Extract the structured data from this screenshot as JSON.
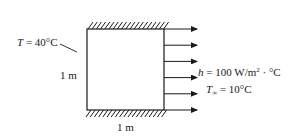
{
  "diagram": {
    "type": "heat-transfer-square-plate",
    "left_boundary": {
      "symbol": "T",
      "equals": " = ",
      "value": "40°C"
    },
    "left_dimension": "1 m",
    "bottom_dimension": "1 m",
    "top_boundary": "insulated",
    "bottom_boundary": "insulated",
    "right_boundary": {
      "type": "convection",
      "arrow_count": 6,
      "h_symbol": "h",
      "h_equals": " = 100 W/m",
      "h_exponent": "2",
      "h_units_tail": " · °C",
      "tinf_symbol": "T",
      "tinf_subscript": "∞",
      "tinf_equals": " = 10°C"
    },
    "colors": {
      "line": "#1a1a1a",
      "background": "#ffffff"
    }
  }
}
